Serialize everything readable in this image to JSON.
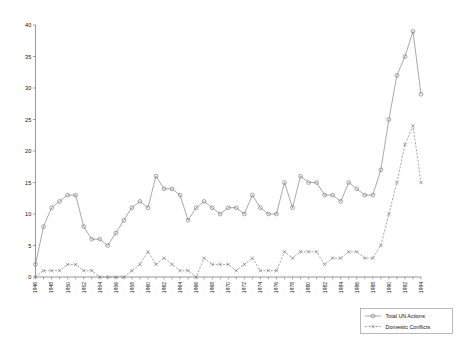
{
  "chart_data": {
    "type": "line",
    "title": "",
    "xlabel": "",
    "ylabel": "",
    "ylim": [
      0,
      40
    ],
    "ytick_step": 5,
    "yticks": [
      0,
      5,
      10,
      15,
      20,
      25,
      30,
      35,
      40
    ],
    "grid": false,
    "legend_position": "bottom-right",
    "x": [
      1946,
      1947,
      1948,
      1949,
      1950,
      1951,
      1952,
      1953,
      1954,
      1955,
      1956,
      1957,
      1958,
      1959,
      1960,
      1961,
      1962,
      1963,
      1964,
      1965,
      1966,
      1967,
      1968,
      1969,
      1970,
      1971,
      1972,
      1973,
      1974,
      1975,
      1976,
      1977,
      1978,
      1979,
      1980,
      1981,
      1982,
      1983,
      1984,
      1985,
      1986,
      1987,
      1988,
      1989,
      1990,
      1991,
      1992,
      1993,
      1994
    ],
    "xtick_labels": [
      "1946",
      "1948",
      "1950",
      "1952",
      "1954",
      "1956",
      "1958",
      "1960",
      "1962",
      "1964",
      "1966",
      "1968",
      "1970",
      "1972",
      "1974",
      "1976",
      "1978",
      "1980",
      "1982",
      "1984",
      "1986",
      "1988",
      "1990",
      "1992",
      "1994"
    ],
    "xtick_every": 2,
    "series": [
      {
        "name": "Total UN Actions",
        "marker": "circle",
        "linestyle": "solid",
        "color": "#7a7a7a",
        "values": [
          2,
          8,
          11,
          12,
          13,
          13,
          8,
          6,
          6,
          5,
          7,
          9,
          11,
          12,
          11,
          16,
          14,
          14,
          13,
          9,
          11,
          12,
          11,
          10,
          11,
          11,
          10,
          13,
          11,
          10,
          10,
          15,
          11,
          16,
          15,
          15,
          13,
          13,
          12,
          15,
          14,
          13,
          13,
          17,
          25,
          32,
          35,
          39,
          29
        ]
      },
      {
        "name": "Domestic Conflicts",
        "marker": "x",
        "linestyle": "dashed",
        "color": "#7a7a7a",
        "values": [
          0,
          1,
          1,
          1,
          2,
          2,
          1,
          1,
          0,
          0,
          0,
          0,
          1,
          2,
          4,
          2,
          3,
          2,
          1,
          1,
          0,
          3,
          2,
          2,
          2,
          1,
          2,
          3,
          1,
          1,
          1,
          4,
          3,
          4,
          4,
          4,
          2,
          3,
          3,
          4,
          4,
          3,
          3,
          5,
          10,
          15,
          21,
          24,
          15
        ]
      }
    ]
  },
  "legend": {
    "items": [
      {
        "label": "Total UN Actions",
        "marker": "circle"
      },
      {
        "label": "Domestic Conflicts",
        "marker": "x"
      }
    ]
  }
}
